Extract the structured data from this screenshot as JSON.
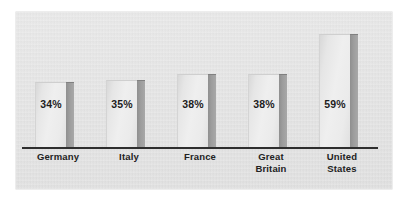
{
  "chart_data": {
    "type": "bar",
    "title": "",
    "subtitle": "",
    "xlabel": "",
    "ylabel": "",
    "ylim": [
      0,
      70
    ],
    "grid": false,
    "legend": null,
    "categories": [
      "Germany",
      "Italy",
      "France",
      "Great Britain",
      "United States"
    ],
    "category_lines": [
      [
        "Germany"
      ],
      [
        "Italy"
      ],
      [
        "France"
      ],
      [
        "Great",
        "Britain"
      ],
      [
        "United",
        "States"
      ]
    ],
    "values": [
      34,
      35,
      38,
      38,
      59
    ],
    "value_labels": [
      "34%",
      "35%",
      "38%",
      "38%",
      "59%"
    ],
    "axis": {
      "baseline_visible": true,
      "y_axis_visible": false,
      "tick_labels": []
    }
  },
  "style": {
    "panel_background": "#e4e4e4",
    "page_background": "#ffffff",
    "bar_face_light": "#efefef",
    "bar_face_dark": "#d8d8d8",
    "bar_shadow": "#9d9d9d",
    "axis_color": "#2e2e2e",
    "label_color": "#222222",
    "value_color": "#1d1d1d"
  }
}
